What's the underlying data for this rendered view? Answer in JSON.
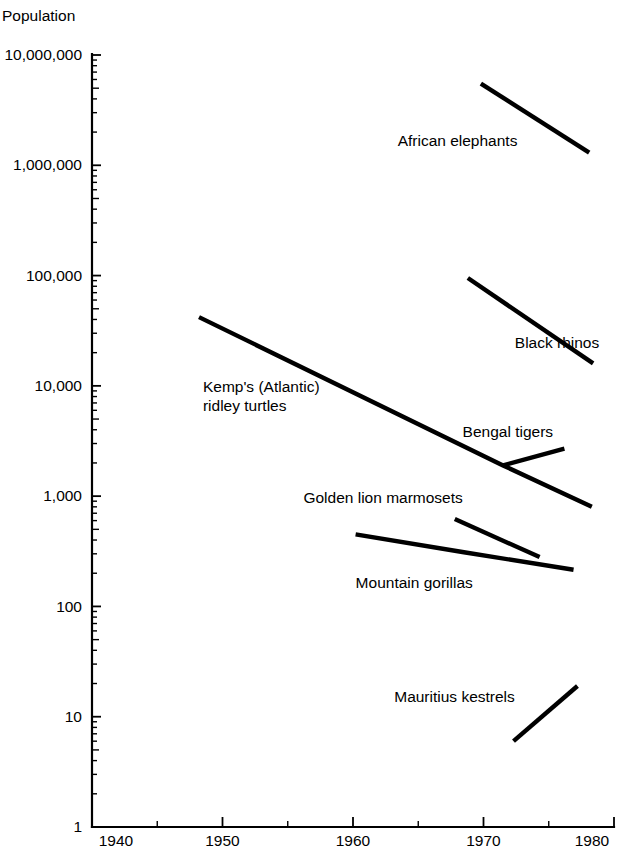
{
  "chart_data": {
    "type": "line",
    "title": "",
    "ylabel": "Population",
    "xlabel": "",
    "yscale": "log",
    "ylim": [
      1,
      10000000
    ],
    "xlim": [
      1940,
      1980
    ],
    "grid": false,
    "legend_position": "inline-annotations",
    "ytick_labels": [
      "10,000,000",
      "1,000,000",
      "100,000",
      "10,000",
      "1,000",
      "100",
      "10",
      "1"
    ],
    "ytick_values": [
      10000000,
      1000000,
      100000,
      10000,
      1000,
      100,
      10,
      1
    ],
    "xtick_labels": [
      "1940",
      "1950",
      "1960",
      "1970",
      "1980"
    ],
    "xtick_values": [
      1940,
      1950,
      1960,
      1970,
      1980
    ],
    "xtick_minor_values": [
      1945,
      1955,
      1965,
      1975
    ],
    "series": [
      {
        "name": "African elephants",
        "label": "African elephants",
        "label_anchor": "end",
        "label_x": 1972.6,
        "label_y": 1900000,
        "x": [
          1969.8,
          1978.1
        ],
        "values": [
          5500000,
          1300000
        ]
      },
      {
        "name": "Black rhinos",
        "label": "Black rhinos",
        "label_anchor": "start",
        "label_x": 1972.4,
        "label_y": 28000,
        "x": [
          1968.8,
          1978.4
        ],
        "values": [
          95000,
          16000
        ]
      },
      {
        "name": "Kemp's (Atlantic) ridley turtles",
        "label": "Kemp's (Atlantic)\nridley turtles",
        "label_anchor": "start",
        "label_x": 1948.5,
        "label_y": 11000,
        "x": [
          1948.2,
          1971.5,
          1978.3
        ],
        "values": [
          42000,
          1900,
          800
        ]
      },
      {
        "name": "Bengal tigers",
        "label": "Bengal tigers",
        "label_anchor": "start",
        "label_x": 1968.4,
        "label_y": 4300,
        "x": [
          1971.5,
          1976.2
        ],
        "values": [
          1900,
          2700
        ]
      },
      {
        "name": "Golden lion marmosets",
        "label": "Golden lion marmosets",
        "label_anchor": "start",
        "label_x": 1956.2,
        "label_y": 1100,
        "x": [
          1967.8,
          1974.3
        ],
        "values": [
          620,
          280
        ]
      },
      {
        "name": "Mountain gorillas",
        "label": "Mountain gorillas",
        "label_anchor": "start",
        "label_x": 1960.2,
        "label_y": 185,
        "x": [
          1960.2,
          1968.5,
          1976.9
        ],
        "values": [
          450,
          310,
          215
        ]
      },
      {
        "name": "Mauritius kestrels",
        "label": "Mauritius kestrels",
        "label_anchor": "end",
        "label_x": 1972.4,
        "label_y": 17,
        "x": [
          1972.3,
          1977.2
        ],
        "values": [
          6,
          19
        ]
      }
    ]
  },
  "axes": {
    "y_axis_title": "Population",
    "y_axis_title_x": 2,
    "y_axis_title_y": 10
  },
  "colors": {
    "ink": "#000000",
    "background": "#ffffff"
  }
}
